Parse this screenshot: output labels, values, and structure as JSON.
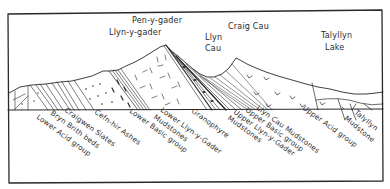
{
  "diagram": {
    "type": "geological cross-section sketch",
    "top_labels": [
      {
        "id": "pen-y-gader",
        "text": "Pen-y-gader",
        "x": 132,
        "y": 23
      },
      {
        "id": "llyn-y-gader",
        "text": "Llyn-y-gader",
        "x": 109,
        "y": 35
      },
      {
        "id": "craig-cau",
        "text": "Craig Cau",
        "x": 228,
        "y": 29
      },
      {
        "id": "llyn-cau-1",
        "text": "Llyn",
        "x": 205,
        "y": 40
      },
      {
        "id": "llyn-cau-2",
        "text": "Cau",
        "x": 205,
        "y": 51
      },
      {
        "id": "talyllyn-1",
        "text": "Talyllyn",
        "x": 321,
        "y": 38
      },
      {
        "id": "talyllyn-2",
        "text": "Lake",
        "x": 325,
        "y": 50
      }
    ],
    "formation_labels": [
      {
        "id": "lower-acid-group",
        "text": "Lower Acid group",
        "x": 36,
        "y": 123
      },
      {
        "id": "bryn-brith-beds",
        "text": "Bryn Brith beds",
        "x": 50,
        "y": 117
      },
      {
        "id": "craigwen-slates",
        "text": "Craigwen Slates",
        "x": 63,
        "y": 114
      },
      {
        "id": "cefn-hir-ashes",
        "text": "Cefn-hir Ashes",
        "x": 93,
        "y": 115
      },
      {
        "id": "lower-basic-group",
        "text": "Lower Basic group",
        "x": 129,
        "y": 113
      },
      {
        "id": "lower-mudstones",
        "text": "Mudstones",
        "x": 153,
        "y": 120
      },
      {
        "id": "lower-llyn-y-gader",
        "text": "Lower Llyn-y-Gader",
        "x": 161,
        "y": 113
      },
      {
        "id": "granophyre",
        "text": "Granophyre",
        "x": 190,
        "y": 113
      },
      {
        "id": "upper-mudstones",
        "text": "Mudstones",
        "x": 232,
        "y": 121
      },
      {
        "id": "upper-llyn-y-gader",
        "text": "Upper Llyn-y-Gader",
        "x": 236,
        "y": 114
      },
      {
        "id": "upper-basic-group",
        "text": "Upper Basic group",
        "x": 248,
        "y": 112
      },
      {
        "id": "llyn-cau-mudstones",
        "text": "Llyn Cau Mudstones",
        "x": 257,
        "y": 109
      },
      {
        "id": "upper-acid-group",
        "text": "Upper Acid group",
        "x": 302,
        "y": 110
      },
      {
        "id": "talyllyn-mudstone-1",
        "text": "Talyllyn",
        "x": 355,
        "y": 115
      },
      {
        "id": "talyllyn-mudstone-2",
        "text": "Mudstone",
        "x": 345,
        "y": 121
      }
    ],
    "colors": {
      "ink": "#2a2a2a",
      "paper": "#ffffff"
    }
  }
}
